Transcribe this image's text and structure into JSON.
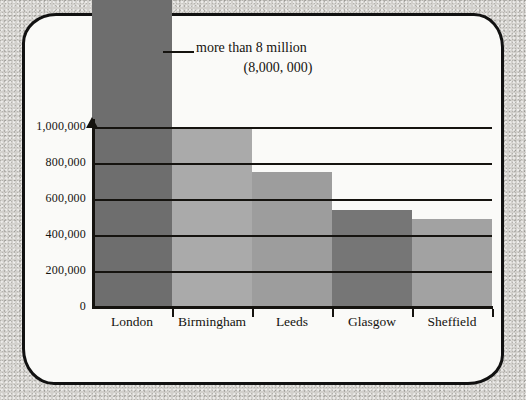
{
  "chart_data": {
    "type": "bar",
    "title": "",
    "xlabel": "",
    "ylabel": "",
    "categories": [
      "London",
      "Birmingham",
      "Leeds",
      "Glasgow",
      "Sheffield"
    ],
    "values": [
      8000000,
      1000000,
      750000,
      540000,
      490000
    ],
    "display_values": [
      "8,000,000",
      "1,000,000",
      "750,000",
      "540,000",
      "490,000"
    ],
    "bar_colors": [
      "#6e6e6e",
      "#aaaaaa",
      "#9d9d9d",
      "#767676",
      "#a2a2a2"
    ],
    "ylim": [
      0,
      1000000
    ],
    "yticks": [
      0,
      200000,
      400000,
      600000,
      800000,
      1000000
    ],
    "ytick_labels": [
      "0",
      "200,000",
      "400,000",
      "600,000",
      "800,000",
      "1,000,000"
    ],
    "grid": true,
    "legend": "none",
    "annotations": [
      {
        "target": "London",
        "line1": "more than 8 million",
        "line2": "(8,000, 000)",
        "leader": "horizontal-leader-line"
      }
    ]
  },
  "axes": {
    "y_axis_arrow": "up-arrow",
    "x_axis_ticks": 5
  },
  "frame": {
    "style": "hand-drawn-rounded-border",
    "border_color": "#111111",
    "paper_color": "#fafaf8",
    "background_color": "#d2d0cc"
  }
}
